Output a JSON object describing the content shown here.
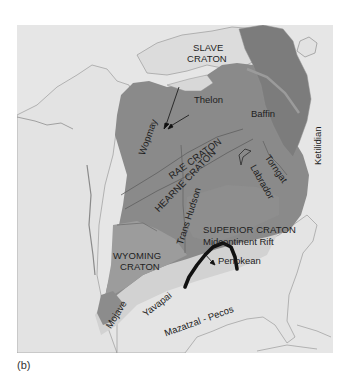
{
  "figure": {
    "caption_label": "(b)"
  },
  "colors": {
    "background": "#e6e6e6",
    "ocean": "#e6e6e6",
    "land_light": "#e0e0e0",
    "craton_dark": "#7a7a7a",
    "craton_mid": "#8e8e8e",
    "province_medium": "#a5a5a5",
    "province_light": "#d4d4d4",
    "rift": "#111111",
    "coastline": "#8a8a8a",
    "label_text": "#1e1e1e"
  },
  "labels": {
    "slave_craton_line1": "SLAVE",
    "slave_craton_line2": "CRATON",
    "thelon": "Thelon",
    "baffin": "Baffin",
    "wopmay": "Wopmay",
    "rae_craton": "RAE CRATON",
    "hearne_craton": "HEARNE CRATON",
    "trans_hudson": "Trans Hudson",
    "torngat": "Torngat",
    "labrador": "Labrador",
    "ketilidian": "Ketilidian",
    "superior_craton": "SUPERIOR CRATON",
    "midcontinent_rift": "Midcontinent Rift",
    "penokean": "Penokean",
    "wyoming_craton_line1": "WYOMING",
    "wyoming_craton_line2": "CRATON",
    "mojave": "Mojave",
    "yavapai": "Yavapai",
    "mazatzal_pecos": "Mazatzal - Pecos"
  }
}
